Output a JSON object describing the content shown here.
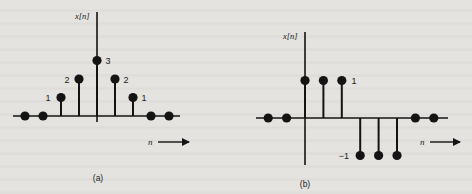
{
  "figure": {
    "background_color": "#e4e3e0",
    "ink_color": "#141414"
  },
  "chart_data": [
    {
      "type": "stem",
      "panel_label": "(a)",
      "ylabel": "x[n]",
      "xlabel": "n",
      "n_relative_to_origin": [
        -4,
        -3,
        -2,
        -1,
        0,
        1,
        2,
        3,
        4
      ],
      "values": [
        0,
        0,
        1,
        2,
        3,
        2,
        1,
        0,
        0
      ],
      "value_labels": [
        {
          "n": -2,
          "text": "1",
          "side": "left"
        },
        {
          "n": -1,
          "text": "2",
          "side": "left"
        },
        {
          "n": 0,
          "text": "3",
          "side": "right"
        },
        {
          "n": 1,
          "text": "2",
          "side": "right"
        },
        {
          "n": 2,
          "text": "1",
          "side": "right"
        }
      ],
      "grid": false,
      "legend": null
    },
    {
      "type": "stem",
      "panel_label": "(b)",
      "ylabel": "x[n]",
      "xlabel": "n",
      "n_relative_to_origin": [
        -2,
        -1,
        0,
        1,
        2,
        3,
        4,
        5,
        6,
        7
      ],
      "values": [
        0,
        0,
        1,
        1,
        1,
        -1,
        -1,
        -1,
        0,
        0
      ],
      "value_labels": [
        {
          "n": 2,
          "text": "1",
          "side": "right"
        },
        {
          "n": 3,
          "text": "−1",
          "side": "left"
        }
      ],
      "grid": false,
      "legend": null
    }
  ],
  "labels": {
    "a": {
      "ylabel": "x[n]",
      "xlabel": "n",
      "panel": "(a)",
      "v1l": "1",
      "v2l": "2",
      "v3": "3",
      "v2r": "2",
      "v1r": "1"
    },
    "b": {
      "ylabel": "x[n]",
      "xlabel": "n",
      "panel": "(b)",
      "v1": "1",
      "vm1": "−1"
    }
  }
}
